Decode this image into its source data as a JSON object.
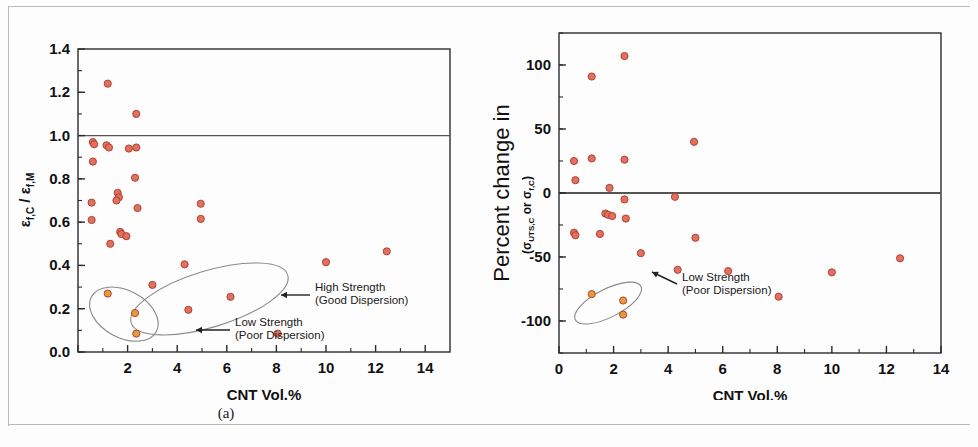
{
  "figure": {
    "background": "#fdfdfd",
    "border_color": "#b9b9b9",
    "marker_color": "#e2705f",
    "marker_edge_color": "#a83a2b",
    "highlight_marker_color": "#e79a3c",
    "axis_color": "#2b2b2b",
    "reference_line_color": "#555555",
    "ellipse_color": "#8a8a8a"
  },
  "panels": [
    {
      "id": "a",
      "letter": "(a)",
      "xlabel": "CNT Vol.%",
      "ylabel_parts": {
        "num_base": "ε",
        "num_sub": "f,C",
        "slash": " / ",
        "den_base": "ε",
        "den_sub": "f,M"
      },
      "ylabel_plain": "εf,C / εf,M",
      "annotations": [
        {
          "id": "low-strength-a",
          "line1": "Low Strength",
          "line2": "(Poor Dispersion)"
        },
        {
          "id": "high-strength-a",
          "line1": "High Strength",
          "line2": "(Good Dispersion)"
        }
      ]
    },
    {
      "id": "b",
      "letter": "(b)",
      "xlabel": "CNT Vol.%",
      "ylabel_main": "Percent change in",
      "ylabel_sub_parts": {
        "open": "(",
        "s1_base": "σ",
        "s1_sub": "UTS,C",
        "mid": " or ",
        "s2_base": "σ",
        "s2_sub": "f,C",
        "close": ")"
      },
      "ylabel_sub_plain": "(σUTS,C or σf,C)",
      "annotations": [
        {
          "id": "low-strength-b",
          "line1": "Low Strength",
          "line2": "(Poor Dispersion)"
        }
      ]
    }
  ],
  "chart_data": [
    {
      "type": "scatter",
      "id": "panel-a",
      "title": "",
      "xlabel": "CNT Vol.%",
      "ylabel": "εf,C / εf,M",
      "xlim": [
        0,
        15
      ],
      "ylim": [
        0.0,
        1.4
      ],
      "xticks": [
        0,
        2,
        4,
        6,
        8,
        10,
        12,
        14
      ],
      "xticklabels": [
        "",
        "2",
        "4",
        "6",
        "8",
        "10",
        "12",
        "14"
      ],
      "yticks": [
        0.0,
        0.2,
        0.4,
        0.6,
        0.8,
        1.0,
        1.2,
        1.4
      ],
      "yticklabels": [
        "0.0",
        "0.2",
        "0.4",
        "0.6",
        "0.8",
        "1.0",
        "1.2",
        "1.4"
      ],
      "grid": false,
      "legend": "none",
      "reference_lines": [
        {
          "orientation": "horizontal",
          "value": 1.0
        }
      ],
      "series": [
        {
          "name": "Normalized failure strain",
          "color": "#e2705f",
          "points": [
            [
              0.6,
              0.97
            ],
            [
              0.65,
              0.96
            ],
            [
              0.6,
              0.88
            ],
            [
              0.55,
              0.69
            ],
            [
              0.55,
              0.61
            ],
            [
              1.2,
              1.24
            ],
            [
              1.15,
              0.955
            ],
            [
              1.25,
              0.945
            ],
            [
              1.3,
              0.5
            ],
            [
              1.6,
              0.735
            ],
            [
              1.65,
              0.715
            ],
            [
              1.55,
              0.7
            ],
            [
              1.7,
              0.555
            ],
            [
              1.75,
              0.545
            ],
            [
              1.95,
              0.535
            ],
            [
              2.05,
              0.94
            ],
            [
              2.35,
              0.945
            ],
            [
              2.35,
              1.1
            ],
            [
              2.3,
              0.805
            ],
            [
              2.4,
              0.665
            ],
            [
              3.0,
              0.31
            ],
            [
              4.3,
              0.405
            ],
            [
              4.45,
              0.195
            ],
            [
              4.95,
              0.685
            ],
            [
              4.95,
              0.615
            ],
            [
              6.15,
              0.255
            ],
            [
              8.05,
              0.085
            ],
            [
              10.0,
              0.415
            ],
            [
              12.45,
              0.465
            ]
          ]
        },
        {
          "name": "Low strength (poor dispersion)",
          "color": "#e79a3c",
          "points": [
            [
              1.2,
              0.27
            ],
            [
              2.3,
              0.18
            ],
            [
              2.35,
              0.085
            ]
          ]
        }
      ],
      "annotations": [
        {
          "text": "Low Strength (Poor Dispersion)",
          "points_to": [
            2.0,
            0.13
          ]
        },
        {
          "text": "High Strength (Good Dispersion)",
          "points_to": [
            7.0,
            0.21
          ]
        }
      ],
      "ellipses": [
        {
          "label": "low-strength",
          "cx": 1.85,
          "cy": 0.175,
          "rx": 0.95,
          "ry": 0.17,
          "angle": -62
        },
        {
          "label": "high-strength",
          "cx": 5.3,
          "cy": 0.245,
          "rx": 3.3,
          "ry": 0.13,
          "angle": -17
        }
      ]
    },
    {
      "type": "scatter",
      "id": "panel-b",
      "title": "",
      "xlabel": "CNT Vol.%",
      "ylabel": "Percent change in (σUTS,C or σf,C)",
      "xlim": [
        0,
        14
      ],
      "ylim": [
        -125,
        125
      ],
      "xticks": [
        0,
        2,
        4,
        6,
        8,
        10,
        12,
        14
      ],
      "xticklabels": [
        "0",
        "2",
        "4",
        "6",
        "8",
        "10",
        "12",
        "14"
      ],
      "yticks": [
        -100,
        -50,
        0,
        50,
        100
      ],
      "yticklabels": [
        "-100",
        "-50",
        "0",
        "50",
        "100"
      ],
      "grid": false,
      "legend": "none",
      "reference_lines": [
        {
          "orientation": "horizontal",
          "value": 0
        }
      ],
      "series": [
        {
          "name": "Percent change in strength",
          "color": "#e2705f",
          "points": [
            [
              0.55,
              25
            ],
            [
              0.6,
              10
            ],
            [
              0.55,
              -31
            ],
            [
              0.6,
              -33
            ],
            [
              1.2,
              91
            ],
            [
              1.2,
              27
            ],
            [
              1.5,
              -32
            ],
            [
              1.7,
              -16
            ],
            [
              1.8,
              -17
            ],
            [
              1.95,
              -18
            ],
            [
              1.85,
              4
            ],
            [
              2.4,
              107
            ],
            [
              2.4,
              26
            ],
            [
              2.4,
              -5
            ],
            [
              2.45,
              -20
            ],
            [
              3.0,
              -47
            ],
            [
              4.25,
              -3
            ],
            [
              4.35,
              -60
            ],
            [
              4.95,
              40
            ],
            [
              5.0,
              -35
            ],
            [
              6.2,
              -61
            ],
            [
              8.05,
              -81
            ],
            [
              10.0,
              -62
            ],
            [
              12.5,
              -51
            ]
          ]
        },
        {
          "name": "Low strength (poor dispersion)",
          "color": "#e79a3c",
          "points": [
            [
              1.2,
              -79
            ],
            [
              2.35,
              -84
            ],
            [
              2.35,
              -95
            ]
          ]
        }
      ],
      "annotations": [
        {
          "text": "Low Strength (Poor Dispersion)",
          "points_to": [
            3.0,
            -92
          ]
        }
      ],
      "ellipses": [
        {
          "label": "low-strength",
          "cx": 1.8,
          "cy": -86,
          "rx": 1.35,
          "ry": 11,
          "angle": -27
        }
      ]
    }
  ]
}
